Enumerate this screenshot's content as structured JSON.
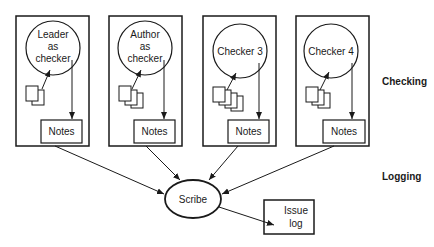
{
  "diagram": {
    "checkers": [
      {
        "label_lines": [
          "Leader",
          "as",
          "checker"
        ],
        "notes": "Notes",
        "doc_count": 2
      },
      {
        "label_lines": [
          "Author",
          "as",
          "checker"
        ],
        "notes": "Notes",
        "doc_count": 3
      },
      {
        "label_lines": [
          "Checker 3"
        ],
        "notes": "Notes",
        "doc_count": 4
      },
      {
        "label_lines": [
          "Checker 4"
        ],
        "notes": "Notes",
        "doc_count": 3
      }
    ],
    "scribe": "Scribe",
    "issue_log": [
      "Issue",
      "log"
    ],
    "phases": {
      "checking": "Checking",
      "logging": "Logging"
    }
  }
}
